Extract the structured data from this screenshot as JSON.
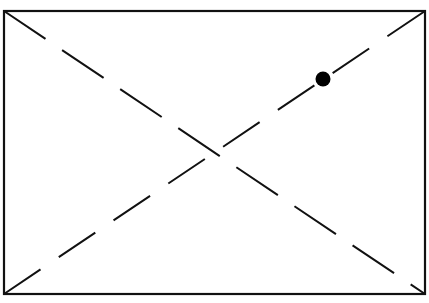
{
  "diagram": {
    "width": 429,
    "height": 303,
    "background": "#ffffff",
    "stroke_color": "#111111",
    "rectangle": {
      "x1": 4,
      "y1": 11,
      "x2": 425,
      "y2": 294,
      "stroke_width": 2.2
    },
    "diagonals": [
      {
        "name": "diagonal-top-left-to-bottom-right",
        "x1": 4,
        "y1": 11,
        "x2": 425,
        "y2": 294,
        "dash": "50,20",
        "stroke_width": 2
      },
      {
        "name": "diagonal-bottom-left-to-top-right",
        "x1": 4,
        "y1": 294,
        "x2": 425,
        "y2": 11,
        "dash": "44,22",
        "stroke_width": 2
      }
    ],
    "point": {
      "cx": 323,
      "cy": 79,
      "r": 7.5,
      "fill": "#000000"
    }
  }
}
